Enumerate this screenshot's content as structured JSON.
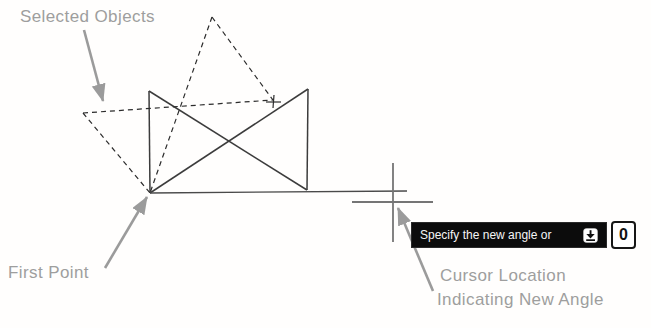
{
  "labels": {
    "selected_objects": "Selected Objects",
    "first_point": "First Point",
    "cursor_location_1": "Cursor Location",
    "cursor_location_2": "Indicating New Angle"
  },
  "tooltip": {
    "prompt": "Specify the new angle or",
    "value": "0",
    "icon": "down-arrow-key-icon"
  },
  "colors": {
    "object_line": "#3c3c3c",
    "dashed_line": "#2c2c2c",
    "baseline": "#4a4a4a",
    "crosshair": "#757575",
    "annotation": "#9b9b9b",
    "tooltip_bg": "#0c0c0c",
    "tooltip_text": "#f5f5f5",
    "background": "#fffefd"
  },
  "diagram": {
    "width": 651,
    "height": 328,
    "solid_lines": [
      [
        149,
        91,
        150,
        193
      ],
      [
        308,
        89,
        307,
        190
      ],
      [
        149,
        91,
        307,
        190
      ],
      [
        308,
        89,
        150,
        193
      ]
    ],
    "baseline": [
      [
        150,
        193,
        407,
        191
      ]
    ],
    "dashed_lines": [
      [
        83,
        113,
        150,
        193
      ],
      [
        212,
        17,
        273,
        100
      ],
      [
        83,
        113,
        273,
        100
      ],
      [
        212,
        17,
        150,
        193
      ]
    ],
    "cross_marker": [
      [
        266,
        102,
        281,
        102
      ],
      [
        274,
        95,
        273,
        108
      ]
    ],
    "crosshair": [
      [
        393,
        163,
        393,
        242
      ],
      [
        352,
        202,
        433,
        202
      ]
    ],
    "arrows": [
      [
        84,
        30,
        103,
        101
      ],
      [
        105,
        268,
        147,
        197
      ],
      [
        433,
        291,
        398,
        208
      ]
    ]
  }
}
